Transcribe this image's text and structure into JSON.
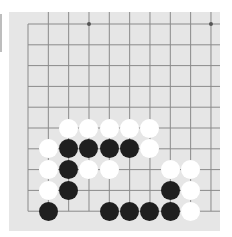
{
  "game": {
    "type": "gomoku-board",
    "grid": {
      "columns": 10,
      "rows": 10,
      "origin_x": 28,
      "origin_y": 24,
      "spacing_x": 20.33,
      "spacing_y": 20.8
    },
    "colors": {
      "board": "#e6e6e6",
      "line": "#8a8a8a",
      "black": "#1f1f1f",
      "white": "#ffffff"
    },
    "star_points": [
      {
        "col": 3,
        "row": 0
      },
      {
        "col": 9,
        "row": 0
      }
    ],
    "stones": [
      {
        "col": 2,
        "row": 5,
        "color": "white"
      },
      {
        "col": 3,
        "row": 5,
        "color": "white"
      },
      {
        "col": 4,
        "row": 5,
        "color": "white"
      },
      {
        "col": 5,
        "row": 5,
        "color": "white"
      },
      {
        "col": 6,
        "row": 5,
        "color": "white"
      },
      {
        "col": 1,
        "row": 6,
        "color": "white"
      },
      {
        "col": 2,
        "row": 6,
        "color": "black"
      },
      {
        "col": 3,
        "row": 6,
        "color": "black"
      },
      {
        "col": 4,
        "row": 6,
        "color": "black"
      },
      {
        "col": 5,
        "row": 6,
        "color": "black"
      },
      {
        "col": 6,
        "row": 6,
        "color": "white"
      },
      {
        "col": 1,
        "row": 7,
        "color": "white"
      },
      {
        "col": 2,
        "row": 7,
        "color": "black"
      },
      {
        "col": 3,
        "row": 7,
        "color": "white"
      },
      {
        "col": 4,
        "row": 7,
        "color": "white"
      },
      {
        "col": 7,
        "row": 7,
        "color": "white"
      },
      {
        "col": 8,
        "row": 7,
        "color": "white"
      },
      {
        "col": 1,
        "row": 8,
        "color": "white"
      },
      {
        "col": 2,
        "row": 8,
        "color": "black"
      },
      {
        "col": 7,
        "row": 8,
        "color": "black"
      },
      {
        "col": 8,
        "row": 8,
        "color": "white"
      },
      {
        "col": 1,
        "row": 9,
        "color": "black"
      },
      {
        "col": 4,
        "row": 9,
        "color": "black"
      },
      {
        "col": 5,
        "row": 9,
        "color": "black"
      },
      {
        "col": 6,
        "row": 9,
        "color": "black"
      },
      {
        "col": 7,
        "row": 9,
        "color": "black"
      },
      {
        "col": 8,
        "row": 9,
        "color": "white"
      }
    ]
  }
}
